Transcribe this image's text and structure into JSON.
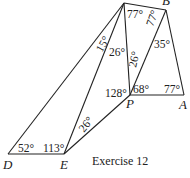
{
  "figure": {
    "caption": "Exercise 12",
    "points": {
      "B": "B",
      "P": "P",
      "A": "A",
      "D": "D",
      "E": "E"
    },
    "angles": {
      "C_top_left": "15°",
      "C_mid": "26°",
      "C_right": "77°",
      "B_left": "77°",
      "B_right": "35°",
      "CP_side": "26°",
      "P_left": "128°",
      "P_right": "68°",
      "A": "77°",
      "D": "52°",
      "E": "113°",
      "E_right": "26°"
    }
  }
}
